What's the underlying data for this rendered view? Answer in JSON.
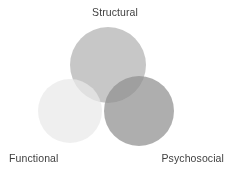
{
  "figure": {
    "type": "venn-diagram",
    "background_color": "#ffffff",
    "label_color": "#3f3f3f"
  },
  "labels": {
    "top": "Structural",
    "bottom_left": "Functional",
    "bottom_right": "Psychosocial"
  },
  "chart_data": {
    "type": "venn",
    "title": "",
    "sets": [
      {
        "name": "Structural",
        "label": "Structural",
        "label_position": "top-center",
        "cx": 108,
        "cy": 65,
        "r": 38,
        "fill": "#b2b2b2",
        "opacity": 0.72
      },
      {
        "name": "Functional",
        "label": "Functional",
        "label_position": "bottom-left",
        "cx": 70,
        "cy": 111,
        "r": 32,
        "fill": "#e9e9e9",
        "opacity": 0.72
      },
      {
        "name": "Psychosocial",
        "label": "Psychosocial",
        "label_position": "bottom-right",
        "cx": 139,
        "cy": 111,
        "r": 35,
        "fill": "#8f8f8f",
        "opacity": 0.72
      }
    ],
    "blend_mode": "multiply",
    "legend": "none",
    "grid": false,
    "axes": false
  }
}
